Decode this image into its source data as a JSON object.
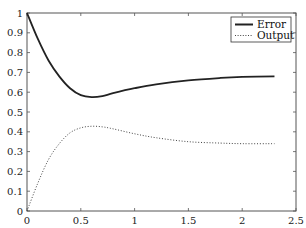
{
  "chart_data": {
    "type": "line",
    "title": "",
    "xlabel": "",
    "ylabel": "",
    "xlim": [
      0,
      2.5
    ],
    "ylim": [
      0,
      1
    ],
    "grid": false,
    "legend_position": "upper right",
    "xticks": [
      "0",
      "0.5",
      "1",
      "1.5",
      "2",
      "2.5"
    ],
    "xtick_values": [
      0,
      0.5,
      1,
      1.5,
      2,
      2.5
    ],
    "yticks": [
      "0",
      "0.1",
      "0.2",
      "0.3",
      "0.4",
      "0.5",
      "0.6",
      "0.7",
      "0.8",
      "0.9",
      "1"
    ],
    "ytick_values": [
      0,
      0.1,
      0.2,
      0.3,
      0.4,
      0.5,
      0.6,
      0.7,
      0.8,
      0.9,
      1
    ],
    "x": [
      0,
      0.1,
      0.2,
      0.3,
      0.4,
      0.5,
      0.6,
      0.7,
      0.8,
      1.0,
      1.2,
      1.5,
      1.8,
      2.0,
      2.3
    ],
    "series": [
      {
        "name": "Error",
        "style": "solid",
        "color": "#222222",
        "values": [
          1.0,
          0.87,
          0.76,
          0.68,
          0.62,
          0.585,
          0.575,
          0.58,
          0.595,
          0.62,
          0.64,
          0.66,
          0.672,
          0.677,
          0.68
        ]
      },
      {
        "name": "Output",
        "style": "dotted",
        "color": "#444444",
        "values": [
          0.0,
          0.14,
          0.26,
          0.34,
          0.395,
          0.42,
          0.428,
          0.425,
          0.415,
          0.39,
          0.37,
          0.35,
          0.343,
          0.34,
          0.34
        ]
      }
    ]
  },
  "legend": {
    "items": [
      {
        "label": "Error"
      },
      {
        "label": "Output"
      }
    ]
  }
}
